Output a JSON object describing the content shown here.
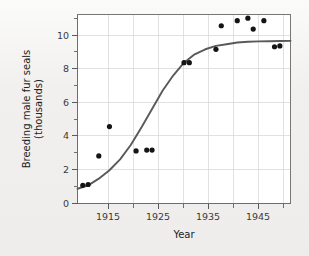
{
  "page": {
    "background_color": "#f1f0ee",
    "plot_background_color": "#ffffff"
  },
  "chart_data": {
    "type": "scatter",
    "title": "",
    "subtitle": "",
    "xlabel": "Year",
    "ylabel": "Breeding male fur seals (thousands)",
    "ylabel_line1": "Breeding male fur seals",
    "ylabel_line2": "(thousands)",
    "xlim": [
      1911,
      1951
    ],
    "ylim": [
      0,
      11.5
    ],
    "grid": true,
    "legend": "none",
    "x_ticks_major": [
      1915,
      1925,
      1935,
      1945
    ],
    "x_tick_labels": [
      "1915",
      "1925",
      "1935",
      "1945"
    ],
    "x_ticks_minor": [
      1920,
      1930,
      1940,
      1950
    ],
    "y_ticks_major": [
      0,
      2,
      4,
      6,
      8,
      10
    ],
    "y_tick_labels": [
      "0",
      "2",
      "4",
      "6",
      "8",
      "10"
    ],
    "y_ticks_minor": [
      1,
      3,
      5,
      7,
      9,
      11
    ],
    "point_color": "#141414",
    "curve_color": "#59595c",
    "grid_color": "#d9d9d9",
    "series": [
      {
        "name": "Breeding male fur seals",
        "marker": "filled-circle",
        "x": [
          1912,
          1913,
          1915,
          1917,
          1922,
          1924,
          1925,
          1931,
          1932,
          1937,
          1938,
          1941,
          1943,
          1944,
          1946,
          1948,
          1949
        ],
        "y": [
          1.05,
          1.1,
          2.8,
          4.55,
          3.1,
          3.15,
          3.15,
          8.35,
          8.35,
          9.15,
          10.55,
          10.85,
          11.0,
          10.35,
          10.85,
          9.3,
          9.35
        ]
      }
    ],
    "fit_curve": {
      "name": "logistic fit",
      "x": [
        1911,
        1913,
        1915,
        1917,
        1919,
        1921,
        1923,
        1925,
        1927,
        1929,
        1931,
        1933,
        1935,
        1937,
        1939,
        1941,
        1943,
        1945,
        1947,
        1949,
        1951
      ],
      "y": [
        0.85,
        1.05,
        1.45,
        1.95,
        2.6,
        3.45,
        4.5,
        5.6,
        6.7,
        7.6,
        8.35,
        8.85,
        9.15,
        9.35,
        9.45,
        9.55,
        9.6,
        9.62,
        9.63,
        9.64,
        9.65
      ]
    }
  }
}
